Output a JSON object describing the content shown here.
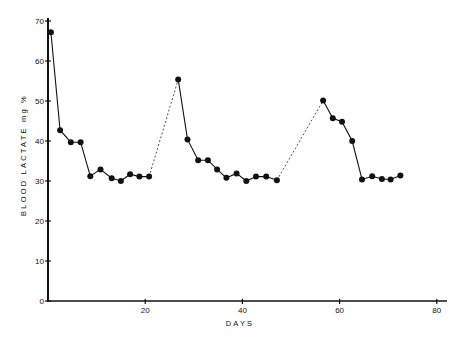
{
  "chart_data": {
    "type": "line",
    "title": "",
    "xlabel": "DAYS",
    "ylabel": "BLOOD   LACTATE   mg %",
    "xlim": [
      0,
      82
    ],
    "ylim": [
      0,
      70
    ],
    "x_ticks": [
      20,
      40,
      60,
      80
    ],
    "x_tick_labels": [
      "20",
      "40",
      "60",
      "80"
    ],
    "y_ticks": [
      0,
      10,
      20,
      30,
      40,
      50,
      60,
      70
    ],
    "y_tick_labels": [
      "0",
      "10",
      "20",
      "30",
      "40",
      "50",
      "60",
      "70"
    ],
    "grid": false,
    "legend": null,
    "series": [
      {
        "name": "Blood lactate (segment 1)",
        "style": "solid",
        "x": [
          0.6,
          2.5,
          4.7,
          6.7,
          8.7,
          10.8,
          13.1,
          15.0,
          16.9,
          18.8,
          20.8
        ],
        "y": [
          67.2,
          42.7,
          39.7,
          39.7,
          31.2,
          32.9,
          30.7,
          30.0,
          31.7,
          31.1,
          31.1
        ]
      },
      {
        "name": "Gap (interpolated)",
        "style": "dashed",
        "x": [
          20.8,
          26.8
        ],
        "y": [
          31.1,
          55.4
        ]
      },
      {
        "name": "Blood lactate (segment 2)",
        "style": "solid",
        "x": [
          26.8,
          28.7,
          30.9,
          32.9,
          34.8,
          36.7,
          38.8,
          40.8,
          42.8,
          44.9,
          47.1
        ],
        "y": [
          55.4,
          40.4,
          35.2,
          35.2,
          32.9,
          30.8,
          31.9,
          30.0,
          31.1,
          31.1,
          30.2
        ]
      },
      {
        "name": "Gap (interpolated)",
        "style": "dashed",
        "x": [
          47.1,
          56.6
        ],
        "y": [
          30.2,
          50.1
        ]
      },
      {
        "name": "Blood lactate (segment 3)",
        "style": "solid",
        "x": [
          56.6,
          58.6,
          60.5,
          62.6,
          64.6,
          66.7,
          68.7,
          70.5,
          72.5
        ],
        "y": [
          50.1,
          45.7,
          44.8,
          40.0,
          30.4,
          31.2,
          30.5,
          30.4,
          31.4
        ]
      }
    ]
  },
  "colors": {
    "ink": "#111111",
    "background": "#ffffff"
  }
}
